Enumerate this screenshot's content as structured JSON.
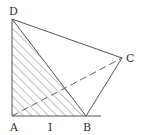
{
  "diagram": {
    "points": {
      "A": {
        "label": "A",
        "x": 12,
        "y": 116
      },
      "B": {
        "label": "B",
        "x": 86,
        "y": 116
      },
      "C": {
        "label": "C",
        "x": 122,
        "y": 58
      },
      "D": {
        "label": "D",
        "x": 12,
        "y": 19
      },
      "I": {
        "label": "I"
      }
    },
    "segments": [
      "AB",
      "BC",
      "CD",
      "DA",
      "DB"
    ],
    "dashed_segments": [
      "AC"
    ],
    "hatched_region": "triangle ABD",
    "colors": {
      "stroke": "#555555",
      "hatch": "#666666",
      "label": "#333333"
    }
  }
}
